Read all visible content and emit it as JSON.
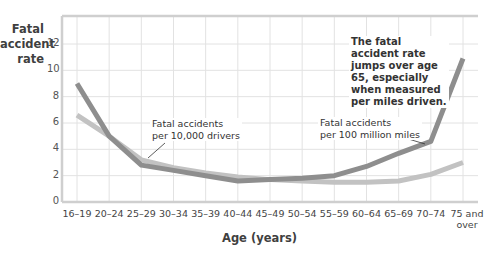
{
  "chart_data": {
    "type": "line",
    "title": "",
    "xlabel": "Age (years)",
    "ylabel": "Fatal accident rate",
    "ylim": [
      0,
      14
    ],
    "yticks": [
      0,
      2,
      4,
      6,
      8,
      10,
      12
    ],
    "grid": true,
    "categories": [
      "16–19",
      "20–24",
      "25–29",
      "30–34",
      "35–39",
      "40–44",
      "45–49",
      "50–54",
      "55–59",
      "60–64",
      "65–69",
      "70–74",
      "75 and over"
    ],
    "series": [
      {
        "name": "Fatal accidents per 100 million miles",
        "color": "#8e8e8e",
        "values": [
          9.0,
          5.0,
          2.8,
          2.4,
          2.0,
          1.6,
          1.7,
          1.8,
          2.0,
          2.7,
          3.7,
          4.6,
          10.9
        ]
      },
      {
        "name": "Fatal accidents per 10,000 drivers",
        "color": "#c2c2c2",
        "values": [
          6.6,
          5.0,
          3.2,
          2.6,
          2.2,
          1.9,
          1.7,
          1.6,
          1.5,
          1.5,
          1.6,
          2.1,
          3.0
        ]
      }
    ],
    "annotations": [
      "Fatal accidents per 10,000 drivers",
      "Fatal accidents per 100 million miles",
      "The fatal accident rate jumps over age 65, especially when measured per miles driven."
    ]
  },
  "labels": {
    "ylabel": "Fatal\naccident\nrate",
    "xlabel": "Age (years)",
    "annot_drivers_1": "Fatal accidents",
    "annot_drivers_2": "per 10,000 drivers",
    "annot_miles_1": "Fatal accidents",
    "annot_miles_2": "per 100 million miles",
    "annot_note": "The fatal accident rate jumps over age 65, especially when measured per miles driven.",
    "x75_1": "75 and",
    "x75_2": "over"
  }
}
